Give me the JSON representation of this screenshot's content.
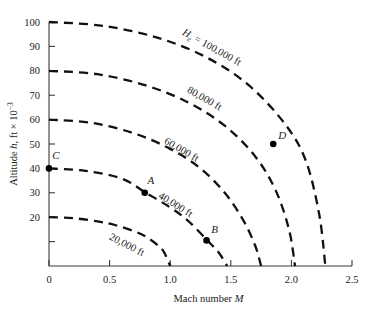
{
  "chart_data": {
    "type": "line",
    "title": "",
    "xlabel": "Mach number M",
    "ylabel": "Altitude h, ft × 10⁻³",
    "xlim": [
      0,
      2.5
    ],
    "ylim": [
      0,
      100
    ],
    "grid": false,
    "legend_position": "inline-curve-labels",
    "x_ticks": [
      "0",
      "0.5",
      "1.0",
      "1.5",
      "2.0",
      "2.5"
    ],
    "x_tick_values": [
      0,
      0.5,
      1.0,
      1.5,
      2.0,
      2.5
    ],
    "y_ticks": [
      "20",
      "30",
      "40",
      "50",
      "60",
      "70",
      "80",
      "90",
      "100"
    ],
    "y_tick_values": [
      20,
      30,
      40,
      50,
      60,
      70,
      80,
      90,
      100
    ],
    "y_minor_tick_values": [
      10
    ],
    "series": [
      {
        "name": "20,000 ft",
        "label": "20,000 ft",
        "label_x": 0.63,
        "label_y": 7.5,
        "label_rotation": 27,
        "x": [
          0.0,
          0.2,
          0.4,
          0.55,
          0.7,
          0.8,
          0.9,
          0.95,
          1.0
        ],
        "values": [
          20.0,
          19.6,
          18.3,
          16.7,
          14.3,
          12.0,
          8.4,
          5.6,
          0.0
        ]
      },
      {
        "name": "40,000 ft",
        "label": "40,000 ft",
        "label_x": 1.03,
        "label_y": 24.0,
        "label_rotation": 32,
        "x": [
          0.0,
          0.3,
          0.6,
          0.8,
          1.0,
          1.15,
          1.3,
          1.4,
          1.47
        ],
        "values": [
          40.0,
          39.0,
          35.8,
          30.0,
          24.0,
          18.4,
          10.8,
          5.5,
          0.0
        ]
      },
      {
        "name": "60,000 ft",
        "label": "60,000 ft",
        "label_x": 1.08,
        "label_y": 46.5,
        "label_rotation": 30,
        "x": [
          0.0,
          0.35,
          0.7,
          1.0,
          1.25,
          1.45,
          1.6,
          1.7,
          1.75
        ],
        "values": [
          60.0,
          58.7,
          54.4,
          48.0,
          40.0,
          30.0,
          19.0,
          8.5,
          0.0
        ]
      },
      {
        "name": "80,000 ft",
        "label": "80,000 ft",
        "label_x": 1.27,
        "label_y": 67.5,
        "label_rotation": 30,
        "x": [
          0.0,
          0.4,
          0.8,
          1.15,
          1.45,
          1.7,
          1.87,
          1.98,
          2.03
        ],
        "values": [
          80.0,
          78.6,
          74.0,
          67.0,
          57.5,
          45.0,
          31.0,
          15.0,
          0.0
        ]
      },
      {
        "name": "H_e = 100,000 ft",
        "label": "= 100,000 ft",
        "label_prefix": "H",
        "label_subscript": "e",
        "label_x": 1.33,
        "label_y": 88.5,
        "label_rotation": 29,
        "x": [
          0.0,
          0.45,
          0.9,
          1.3,
          1.65,
          1.95,
          2.12,
          2.23,
          2.28
        ],
        "values": [
          100.0,
          98.4,
          93.5,
          85.5,
          74.0,
          58.0,
          43.0,
          21.0,
          0.0
        ]
      }
    ],
    "annotated_points": [
      {
        "label": "A",
        "x": 0.79,
        "y": 30.0,
        "label_dx": 6,
        "label_dy": -9
      },
      {
        "label": "B",
        "x": 1.3,
        "y": 10.5,
        "label_dx": 8,
        "label_dy": -7
      },
      {
        "label": "C",
        "x": 0.0,
        "y": 40.0,
        "label_dx": 7,
        "label_dy": -9
      },
      {
        "label": "D",
        "x": 1.85,
        "y": 50.0,
        "label_dx": 9,
        "label_dy": -5
      }
    ]
  }
}
